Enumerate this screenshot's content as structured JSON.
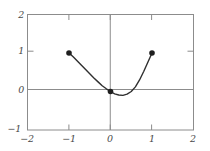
{
  "chart_data": {
    "type": "line",
    "title": "",
    "xlabel": "",
    "ylabel": "",
    "xlim": [
      -2,
      2
    ],
    "ylim": [
      -1,
      2
    ],
    "grid": false,
    "legend": null,
    "x_ticks": [
      -2,
      -1,
      0,
      1,
      2
    ],
    "y_ticks": [
      -1,
      0,
      1,
      2
    ],
    "x_tick_labels": [
      "−2",
      "−1",
      "0",
      "1",
      "2"
    ],
    "y_tick_labels": [
      "−1",
      "0",
      "1",
      "2"
    ],
    "axes_lines": {
      "x_axis_at_y": 0,
      "y_axis_at_x": 0
    },
    "series": [
      {
        "name": "curve",
        "style": "solid",
        "color": "#2f2f2f",
        "x": [
          -1.0,
          -0.9,
          -0.8,
          -0.7,
          -0.6,
          -0.5,
          -0.4,
          -0.3,
          -0.2,
          -0.1,
          0.0,
          0.1,
          0.2,
          0.3,
          0.4,
          0.5,
          0.6,
          0.7,
          0.8,
          0.9,
          1.0
        ],
        "y": [
          1.0,
          0.9,
          0.79,
          0.68,
          0.57,
          0.46,
          0.35,
          0.25,
          0.15,
          0.07,
          0.0,
          -0.06,
          -0.09,
          -0.1,
          -0.07,
          0.0,
          0.12,
          0.3,
          0.52,
          0.76,
          1.0
        ]
      }
    ],
    "markers": [
      {
        "label": "point-left",
        "x": -1,
        "y": 1
      },
      {
        "label": "point-origin",
        "x": 0,
        "y": 0
      },
      {
        "label": "point-right",
        "x": 1,
        "y": 1
      }
    ],
    "colors": {
      "frame": "#8c8c8c",
      "axis": "#8c8c8c",
      "curve": "#2f2f2f",
      "marker": "#1f1f1f",
      "tick_label": "#4a4a4a",
      "background": "#ffffff"
    }
  }
}
